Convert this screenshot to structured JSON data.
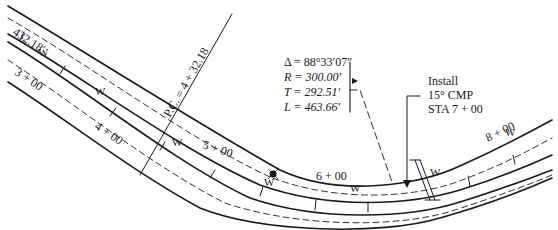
{
  "diagram": {
    "type": "road-plan-horizontal-curve",
    "curve_data": {
      "delta": "Δ = 88°33′07″",
      "radius": "R = 300.00′",
      "tangent": "T = 292.51′",
      "length": "L = 463.66′"
    },
    "pc_label": "P.C. = 4 + 32.18",
    "pc_offset_label": "432.18′",
    "stations": [
      "3 + 00",
      "4 + 00",
      "5 + 00",
      "6 + 00",
      "8 + 00"
    ],
    "water_line_label": "W",
    "install_note": {
      "line1": "Install",
      "line2": "15° CMP",
      "line3": "STA 7 + 00"
    },
    "symbols": [
      "hydrant-icon",
      "culvert-icon",
      "flag-icon"
    ],
    "colors": {
      "line": "#1a1a1a",
      "background": "#ffffff"
    }
  }
}
